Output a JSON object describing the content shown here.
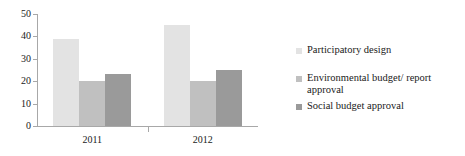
{
  "chart_data": {
    "type": "bar",
    "title": "",
    "subtitle": "",
    "xlabel": "",
    "ylabel": "",
    "categories": [
      "2011",
      "2012"
    ],
    "series": [
      {
        "name": "Participatory design",
        "values": [
          39,
          45
        ],
        "color": "#e3e3e3"
      },
      {
        "name": "Environmental budget/ report approval",
        "values": [
          20,
          20
        ],
        "color": "#c0c0c0"
      },
      {
        "name": "Social budget approval",
        "values": [
          23,
          25
        ],
        "color": "#9a9a9a"
      }
    ],
    "ylim": [
      0,
      50
    ],
    "yticks": [
      0,
      10,
      20,
      30,
      40,
      50
    ],
    "ytick_labels": [
      "0",
      "10",
      "20",
      "30",
      "40",
      "50"
    ],
    "grid": false,
    "legend_position": "right",
    "axis_color": "#a8a8a8",
    "text_color": "#1a1a1a",
    "background": "#ffffff"
  },
  "legend": {
    "entries": [
      {
        "label": "Participatory design"
      },
      {
        "label": "Environmental budget/ report approval"
      },
      {
        "label": "Social budget approval"
      }
    ]
  }
}
